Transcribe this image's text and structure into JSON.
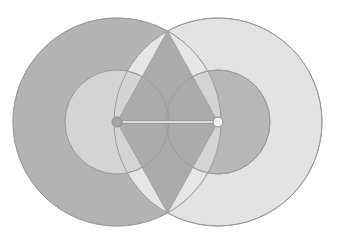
{
  "diagram": {
    "title": "",
    "points": {
      "left_center": {
        "x": 117,
        "y": 122
      },
      "right_center": {
        "x": 218,
        "y": 122
      },
      "top_intersection": {
        "x": 167.5,
        "y": 31
      },
      "bottom_intersection": {
        "x": 167.5,
        "y": 213
      }
    },
    "large_radius": 104,
    "small_radius": 52,
    "dot_radius": 5,
    "colors": {
      "background": "#ffffff",
      "left_large_fill": "#b4b4b4",
      "right_large_fill": "#e3e3e3",
      "left_small_fill": "#dfdfdf",
      "right_small_fill": "#b7b7b7",
      "lens_fill": "#e6e6e6",
      "rhombus_fill": "#ababab",
      "stroke": "#9a9a9a",
      "segment": "#f2f2f2",
      "left_dot_fill": "#a6a6a6",
      "right_dot_fill": "#f2f2f2"
    }
  }
}
